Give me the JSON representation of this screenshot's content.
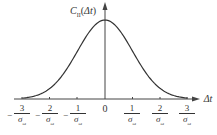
{
  "chart_data": {
    "type": "line",
    "title": "",
    "ylabel": "C_II(Δt)",
    "xlabel": "Δt",
    "x_ticks": [
      "-3/σω",
      "-2/σω",
      "-1/σω",
      "0",
      "1/σω",
      "2/σω",
      "3/σω"
    ],
    "series": [
      {
        "name": "C_II(Δt)",
        "shape": "gaussian",
        "center": 0,
        "x": [
          -3,
          -2,
          -1,
          0,
          1,
          2,
          3
        ],
        "values": [
          0.01,
          0.14,
          0.61,
          1.0,
          0.61,
          0.14,
          0.01
        ]
      }
    ],
    "grid": false,
    "legend": "none"
  },
  "labels": {
    "y_axis": "C",
    "y_axis_sub": "II",
    "y_axis_arg": "(Δt)",
    "x_axis": "Δt",
    "zero": "0",
    "den": "σ",
    "den_sub": "ω",
    "nums": [
      "3",
      "2",
      "1",
      "1",
      "2",
      "3"
    ],
    "minus": "−"
  }
}
